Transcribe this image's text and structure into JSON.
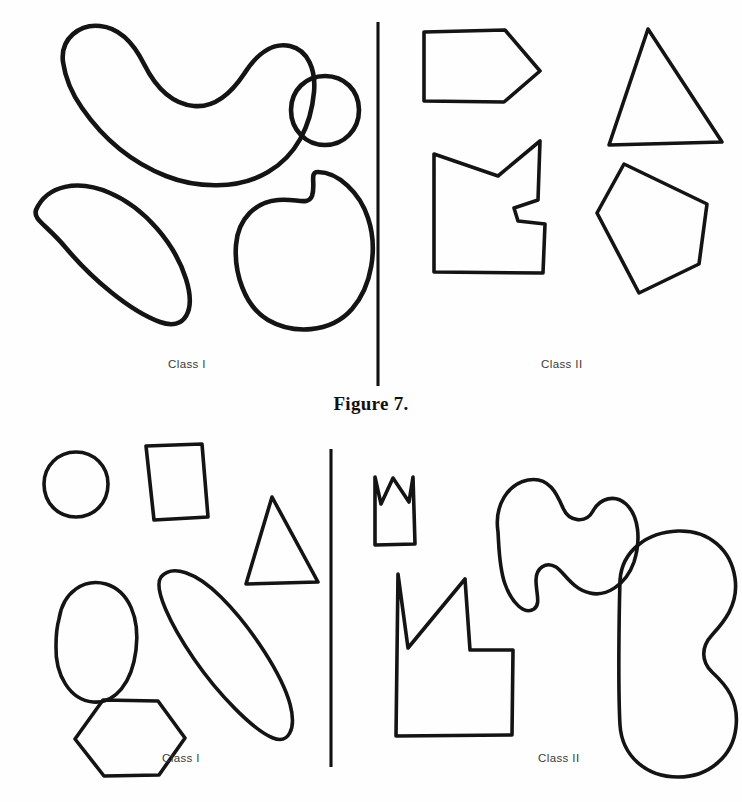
{
  "figure": {
    "caption": "Figure 7.",
    "panels": [
      {
        "id": "top",
        "left_class_label": "Class I",
        "right_class_label": "Class II",
        "divider": {
          "x": 378,
          "y1": 22,
          "y2": 386
        },
        "left_shapes": [
          {
            "name": "crescent-bean-blob",
            "kind": "smooth-curved"
          },
          {
            "name": "small-ellipse",
            "kind": "smooth-curved"
          },
          {
            "name": "large-tilted-ellipse",
            "kind": "smooth-curved"
          },
          {
            "name": "kidney-bean-blob",
            "kind": "smooth-curved"
          }
        ],
        "right_shapes": [
          {
            "name": "arrow-pentagon",
            "kind": "angular-polygon"
          },
          {
            "name": "notched-concave-polygon",
            "kind": "angular-polygon"
          },
          {
            "name": "triangle",
            "kind": "angular-polygon"
          },
          {
            "name": "tilted-pentagon",
            "kind": "angular-polygon"
          }
        ]
      },
      {
        "id": "bottom",
        "left_class_label": "Class I",
        "right_class_label": "Class II",
        "divider": {
          "x": 331,
          "y1": 17,
          "y2": 335
        },
        "left_shapes": [
          {
            "name": "circle",
            "kind": "convex"
          },
          {
            "name": "square",
            "kind": "convex"
          },
          {
            "name": "triangle",
            "kind": "convex"
          },
          {
            "name": "upright-ellipse",
            "kind": "convex"
          },
          {
            "name": "long-tilted-ellipse",
            "kind": "convex"
          },
          {
            "name": "hexagon",
            "kind": "convex"
          }
        ],
        "right_shapes": [
          {
            "name": "small-crown-notch-shape",
            "kind": "concave"
          },
          {
            "name": "large-crown-notch-polygon",
            "kind": "concave"
          },
          {
            "name": "wavy-concave-blob",
            "kind": "concave"
          },
          {
            "name": "large-bean-blob",
            "kind": "concave"
          }
        ]
      }
    ]
  },
  "colors": {
    "ink": "#141414",
    "paper": "#fefefe",
    "label_text": "#3a3a3a",
    "caption_text": "#111111"
  }
}
